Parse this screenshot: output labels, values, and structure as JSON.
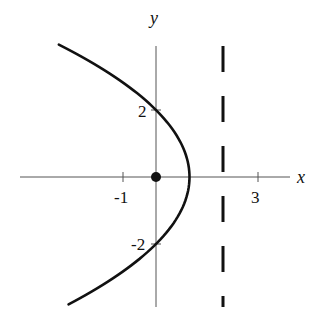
{
  "diagram": {
    "type": "parabola-conic",
    "axes": {
      "x_label": "x",
      "y_label": "y"
    },
    "ticks": {
      "x": [
        {
          "value": -1,
          "label": "-1"
        },
        {
          "value": 3,
          "label": "3"
        }
      ],
      "y": [
        {
          "value": 2,
          "label": "2"
        },
        {
          "value": -2,
          "label": "-2"
        }
      ]
    },
    "parabola": {
      "equation": "x = 1 - y^2/4",
      "vertex": [
        1,
        0
      ],
      "opens": "left",
      "y_range": [
        -3.8,
        3.95
      ],
      "color": "#111111"
    },
    "focus": {
      "point": [
        0,
        0
      ],
      "style": "filled-dot"
    },
    "directrix": {
      "equation": "x = 2",
      "style": "dashed"
    },
    "view": {
      "x_range": [
        -4.1,
        4.0
      ],
      "y_range": [
        -3.9,
        3.9
      ]
    }
  }
}
